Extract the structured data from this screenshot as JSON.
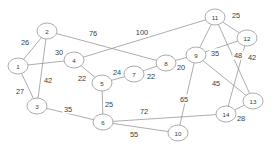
{
  "diagram": {
    "type": "node-link-graph",
    "width": 274,
    "height": 151,
    "background_color": "#ffffff",
    "node_fill_color": "#ffffff",
    "node_stroke_color": "#8a8a8a",
    "edge_color": "#8a8a8a",
    "label_color": "#3c3c3c"
  },
  "nodes": [
    {
      "id": "1",
      "label": "1",
      "x": 18,
      "y": 66,
      "rx": 10,
      "ry": 8
    },
    {
      "id": "2",
      "label": "2",
      "x": 47,
      "y": 31,
      "rx": 10,
      "ry": 8
    },
    {
      "id": "3",
      "label": "3",
      "x": 37,
      "y": 106,
      "rx": 10,
      "ry": 8
    },
    {
      "id": "4",
      "label": "4",
      "x": 74,
      "y": 60,
      "rx": 10,
      "ry": 8
    },
    {
      "id": "5",
      "label": "5",
      "x": 102,
      "y": 83,
      "rx": 10,
      "ry": 8
    },
    {
      "id": "6",
      "label": "6",
      "x": 103,
      "y": 122,
      "rx": 10,
      "ry": 8
    },
    {
      "id": "7",
      "label": "7",
      "x": 134,
      "y": 74,
      "rx": 10,
      "ry": 8
    },
    {
      "id": "8",
      "label": "8",
      "x": 166,
      "y": 63,
      "rx": 10,
      "ry": 8
    },
    {
      "id": "9",
      "label": "9",
      "x": 196,
      "y": 55,
      "rx": 10,
      "ry": 8
    },
    {
      "id": "10",
      "label": "10",
      "x": 178,
      "y": 133,
      "rx": 10,
      "ry": 8
    },
    {
      "id": "11",
      "label": "11",
      "x": 215,
      "y": 17,
      "rx": 10,
      "ry": 8
    },
    {
      "id": "12",
      "label": "12",
      "x": 247,
      "y": 38,
      "rx": 10,
      "ry": 8
    },
    {
      "id": "13",
      "label": "13",
      "x": 253,
      "y": 101,
      "rx": 10,
      "ry": 8
    },
    {
      "id": "14",
      "label": "14",
      "x": 226,
      "y": 114,
      "rx": 10,
      "ry": 8
    }
  ],
  "edges": [
    {
      "from": "1",
      "to": "2",
      "weight": "26",
      "lx": 25,
      "ly": 42
    },
    {
      "from": "1",
      "to": "3",
      "weight": "27",
      "lx": 20,
      "ly": 91
    },
    {
      "from": "2",
      "to": "3",
      "weight": "42",
      "lx": 48,
      "ly": 80
    },
    {
      "from": "1",
      "to": "4",
      "weight": "30",
      "lx": 59,
      "ly": 52
    },
    {
      "from": "2",
      "to": "8",
      "weight": "76",
      "lx": 93,
      "ly": 33
    },
    {
      "from": "4",
      "to": "5",
      "weight": "22",
      "lx": 82,
      "ly": 78
    },
    {
      "from": "4",
      "to": "11",
      "weight": "100",
      "lx": 142,
      "ly": 32
    },
    {
      "from": "5",
      "to": "7",
      "weight": "24",
      "lx": 117,
      "ly": 72
    },
    {
      "from": "5",
      "to": "6",
      "weight": "25",
      "lx": 109,
      "ly": 104
    },
    {
      "from": "7",
      "to": "8",
      "weight": "22",
      "lx": 151,
      "ly": 76
    },
    {
      "from": "8",
      "to": "9",
      "weight": "20",
      "lx": 181,
      "ly": 67
    },
    {
      "from": "3",
      "to": "6",
      "weight": "35",
      "lx": 68,
      "ly": 109
    },
    {
      "from": "6",
      "to": "14",
      "weight": "72",
      "lx": 144,
      "ly": 111
    },
    {
      "from": "6",
      "to": "10",
      "weight": "55",
      "lx": 134,
      "ly": 134
    },
    {
      "from": "9",
      "to": "10",
      "weight": "65",
      "lx": 184,
      "ly": 99
    },
    {
      "from": "9",
      "to": "11",
      "weight": "",
      "lx": 0,
      "ly": 0
    },
    {
      "from": "9",
      "to": "12",
      "weight": "35",
      "lx": 215,
      "ly": 53
    },
    {
      "from": "9",
      "to": "13",
      "weight": "45",
      "lx": 216,
      "ly": 83
    },
    {
      "from": "11",
      "to": "12",
      "weight": "25",
      "lx": 236,
      "ly": 15
    },
    {
      "from": "11",
      "to": "13",
      "weight": "48",
      "lx": 238,
      "ly": 55
    },
    {
      "from": "12",
      "to": "14",
      "weight": "42",
      "lx": 252,
      "ly": 57
    },
    {
      "from": "13",
      "to": "14",
      "weight": "28",
      "lx": 241,
      "ly": 118
    }
  ],
  "edge_labels": [
    {
      "text": "26",
      "x": 25,
      "y": 42
    },
    {
      "text": "27",
      "x": 20,
      "y": 91
    },
    {
      "text": "42",
      "x": 48,
      "y": 80
    },
    {
      "text": "30",
      "x": 59,
      "y": 52
    },
    {
      "text": "76",
      "x": 93,
      "y": 33
    },
    {
      "text": "22",
      "x": 82,
      "y": 78
    },
    {
      "text": "100",
      "x": 142,
      "y": 32
    },
    {
      "text": "24",
      "x": 117,
      "y": 72
    },
    {
      "text": "25",
      "x": 109,
      "y": 104
    },
    {
      "text": "22",
      "x": 151,
      "y": 76
    },
    {
      "text": "20",
      "x": 181,
      "y": 67
    },
    {
      "text": "35",
      "x": 68,
      "y": 109
    },
    {
      "text": "72",
      "x": 144,
      "y": 111
    },
    {
      "text": "55",
      "x": 134,
      "y": 134
    },
    {
      "text": "65",
      "x": 184,
      "y": 99
    },
    {
      "text": "35",
      "x": 215,
      "y": 53
    },
    {
      "text": "45",
      "x": 216,
      "y": 83
    },
    {
      "text": "25",
      "x": 236,
      "y": 15
    },
    {
      "text": "48",
      "x": 238,
      "y": 55
    },
    {
      "text": "42",
      "x": 252,
      "y": 57
    },
    {
      "text": "28",
      "x": 241,
      "y": 118
    }
  ]
}
